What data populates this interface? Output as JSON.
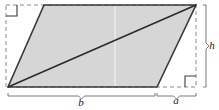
{
  "figure": {
    "type": "geometry-diagram",
    "background_color": "#ffffff",
    "shape": {
      "name": "parallelogram",
      "fill_color": "#d6d6d6",
      "stroke_color": "#3a3a3a",
      "vertices": [
        {
          "id": "top-left",
          "x": 44,
          "y": 5
        },
        {
          "id": "top-right",
          "x": 196,
          "y": 5
        },
        {
          "id": "bottom-right",
          "x": 157,
          "y": 87
        },
        {
          "id": "bottom-left",
          "x": 8,
          "y": 87
        }
      ]
    },
    "diagonal": {
      "name": "diagonal",
      "from": {
        "x": 8,
        "y": 87
      },
      "to": {
        "x": 196,
        "y": 5
      },
      "stroke_color": "#2b2b2b"
    },
    "seam_line": {
      "name": "vertical-seam",
      "x": 115,
      "color": "#efefef"
    },
    "bounding_box": {
      "name": "dashed-rectangle",
      "left": 6,
      "top": 5,
      "right": 196,
      "bottom": 87,
      "stroke_color": "#8c8c8c",
      "dash": "4 3"
    },
    "right_angle_markers": [
      {
        "id": "top-left-right-angle",
        "x": 6,
        "y": 5,
        "size": 11,
        "corner": "top-left"
      },
      {
        "id": "bottom-right-right-angle",
        "x": 196,
        "y": 87,
        "size": 11,
        "corner": "bottom-right"
      }
    ],
    "labels": [
      {
        "id": "base",
        "text": "b",
        "x": 81,
        "y": 106
      },
      {
        "id": "offset",
        "text": "a",
        "x": 176,
        "y": 104
      },
      {
        "id": "height",
        "text": "h",
        "x": 212,
        "y": 49
      }
    ],
    "braces": [
      {
        "id": "brace-b",
        "orientation": "horizontal",
        "from": 8,
        "to": 155,
        "axis": 93,
        "label": "b"
      },
      {
        "id": "brace-a",
        "orientation": "horizontal",
        "from": 157,
        "to": 196,
        "axis": 93,
        "label": "a"
      },
      {
        "id": "brace-h",
        "orientation": "vertical",
        "from": 5,
        "to": 87,
        "axis": 203,
        "label": "h"
      }
    ]
  }
}
